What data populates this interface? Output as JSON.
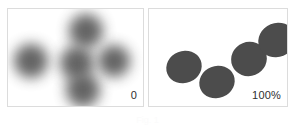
{
  "figure": {
    "background_color": "#ffffff",
    "width": 295,
    "height": 125,
    "caption_fragment": "Fig. 1"
  },
  "panels": [
    {
      "id": "left",
      "name": "blurred-panel",
      "label": "0",
      "border_color": "#dcdcdc",
      "background_color": "#ffffff",
      "blur_amount_label": "0",
      "shape_fill": "#575757",
      "shapes": [
        {
          "name": "blob-left",
          "cx": 23,
          "cy": 52,
          "r": 17
        },
        {
          "name": "blob-center",
          "cx": 69,
          "cy": 54,
          "r": 17
        },
        {
          "name": "blob-top",
          "cx": 78,
          "cy": 22,
          "r": 17
        },
        {
          "name": "blob-right",
          "cx": 106,
          "cy": 52,
          "r": 16
        },
        {
          "name": "blob-bottom",
          "cx": 75,
          "cy": 81,
          "r": 17
        }
      ]
    },
    {
      "id": "right",
      "name": "sharp-panel",
      "label": "100%",
      "border_color": "#dcdcdc",
      "background_color": "#ffffff",
      "blur_amount_label": "100%",
      "shape_fill": "#4c4c4c",
      "shapes": [
        {
          "name": "dot-1",
          "cx": 35,
          "cy": 58,
          "rx": 18,
          "ry": 16,
          "rotate": -22
        },
        {
          "name": "dot-2",
          "cx": 68,
          "cy": 73,
          "rx": 18,
          "ry": 16,
          "rotate": -22
        },
        {
          "name": "dot-3",
          "cx": 100,
          "cy": 50,
          "rx": 18,
          "ry": 17,
          "rotate": -22
        },
        {
          "name": "dot-4",
          "cx": 128,
          "cy": 31,
          "rx": 19,
          "ry": 17,
          "rotate": -22
        }
      ]
    }
  ]
}
